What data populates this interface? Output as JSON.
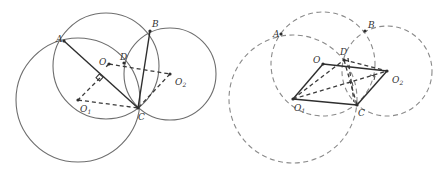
{
  "figures": [
    {
      "id": "left",
      "style": "solid circles",
      "points": {
        "A": {
          "label": "A",
          "x": 64,
          "y": 41
        },
        "B": {
          "label": "B",
          "x": 150,
          "y": 31
        },
        "C": {
          "label": "C",
          "x": 138,
          "y": 108
        },
        "D": {
          "label": "D",
          "x": 124,
          "y": 64
        },
        "O": {
          "label": "O",
          "x": 109,
          "y": 64
        },
        "O1": {
          "label": "O",
          "sub": "1",
          "x": 78,
          "y": 100
        },
        "O2": {
          "label": "O",
          "sub": "2",
          "x": 170,
          "y": 74
        }
      },
      "circles": [
        {
          "name": "circle-O",
          "cx": 106,
          "cy": 66,
          "r": 53
        },
        {
          "name": "circle-O1",
          "cx": 78,
          "cy": 100,
          "r": 62
        },
        {
          "name": "circle-O2",
          "cx": 170,
          "cy": 74,
          "r": 46
        }
      ]
    },
    {
      "id": "right",
      "style": "dashed circles",
      "points": {
        "A": {
          "label": "A",
          "x": 57,
          "y": 34
        },
        "B": {
          "label": "B",
          "x": 141,
          "y": 31
        },
        "C": {
          "label": "C",
          "x": 133,
          "y": 105
        },
        "D": {
          "label": "D",
          "x": 120,
          "y": 60
        },
        "O": {
          "label": "O",
          "x": 99,
          "y": 64
        },
        "O1": {
          "label": "O",
          "sub": "1",
          "x": 69,
          "y": 99
        },
        "O2": {
          "label": "O",
          "sub": "2",
          "x": 163,
          "y": 71
        }
      },
      "circles": [
        {
          "name": "circle-O",
          "cx": 99,
          "cy": 64,
          "r": 52
        },
        {
          "name": "circle-O1",
          "cx": 69,
          "cy": 99,
          "r": 64
        },
        {
          "name": "circle-O2",
          "cx": 163,
          "cy": 71,
          "r": 45
        }
      ]
    }
  ],
  "labels": {
    "A": "A",
    "B": "B",
    "C": "C",
    "D": "D",
    "O": "O",
    "sub1": "1",
    "sub2": "2"
  }
}
